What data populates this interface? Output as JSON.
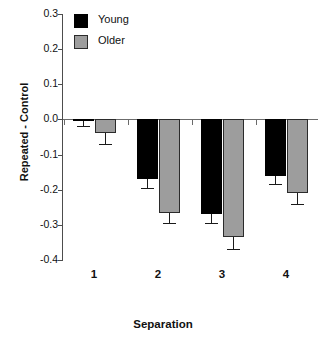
{
  "chart_data": {
    "type": "bar",
    "title": "",
    "xlabel": "Separation",
    "ylabel": "Repeated - Control",
    "categories": [
      "1",
      "2",
      "3",
      "4"
    ],
    "ylim": [
      -0.4,
      0.3
    ],
    "ytick_labels": [
      "0.3",
      "0.2",
      "0.1",
      "0.0",
      "-0.1",
      "-0.2",
      "-0.3",
      "-0.4"
    ],
    "ytick_values": [
      0.3,
      0.2,
      0.1,
      0.0,
      -0.1,
      -0.2,
      -0.3,
      -0.4
    ],
    "grid": false,
    "legend_position": "top-left",
    "series": [
      {
        "name": "Young",
        "color": "#000000",
        "values": [
          -0.005,
          -0.17,
          -0.27,
          -0.16
        ],
        "errors": [
          0.015,
          0.025,
          0.025,
          0.025
        ]
      },
      {
        "name": "Older",
        "color": "#9d9d9d",
        "values": [
          -0.04,
          -0.265,
          -0.335,
          -0.21
        ],
        "errors": [
          0.03,
          0.03,
          0.035,
          0.03
        ]
      }
    ]
  }
}
